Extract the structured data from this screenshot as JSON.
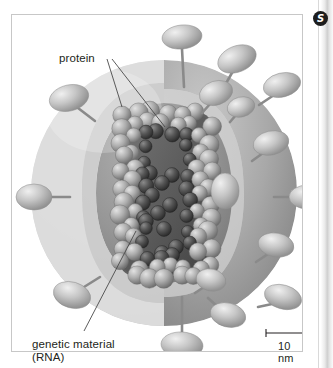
{
  "figure": {
    "badge": {
      "glyph": "S",
      "name": "chapter-badge"
    },
    "labels": {
      "protein": "protein",
      "genetic_material_line1": "genetic material",
      "genetic_material_line2": "(RNA)"
    },
    "scale_bar": {
      "label": "10 nm",
      "length_px": 40
    },
    "colors": {
      "envelope_outer": "#d9d9d9",
      "envelope_mid": "#b4b4b4",
      "envelope_inner": "#9a9a9a",
      "sphere_body": "#8e8e8e",
      "capsid_sphere": "#a0a0a0",
      "capsid_shadow": "#3a3a3a",
      "spike": "#bdbdbd",
      "stalk": "#8a8a8a",
      "leader_line": "#4a4a4a",
      "frame_border": "#c7c7c7",
      "badge_fill": "#1d1d1d",
      "text": "#231f20",
      "background": "#ffffff"
    },
    "structure": {
      "envelope_shape": "sphere-with-wedge-cutaway",
      "core_description": "helical nucleocapsid of globular protein subunits arranged in a rounded rectangular coil",
      "spike_count_visible": 16
    },
    "spikes": [
      {
        "cx": 170,
        "cy": 22,
        "rx": 20,
        "ry": 12,
        "rot": -6,
        "sx": 170,
        "sy": 34,
        "ex": 172,
        "ey": 72,
        "name": "spike-top"
      },
      {
        "cx": 225,
        "cy": 44,
        "rx": 20,
        "ry": 13,
        "rot": -22,
        "sx": 221,
        "sy": 56,
        "ex": 212,
        "ey": 72,
        "name": "spike-top-right"
      },
      {
        "cx": 270,
        "cy": 70,
        "rx": 19,
        "ry": 12,
        "rot": -14,
        "sx": 262,
        "sy": 80,
        "ex": 247,
        "ey": 90,
        "name": "spike-upper-right"
      },
      {
        "cx": 204,
        "cy": 78,
        "rx": 17,
        "ry": 12,
        "rot": -18,
        "sx": 198,
        "sy": 89,
        "ex": 190,
        "ey": 98,
        "name": "spike-surface-a"
      },
      {
        "cx": 259,
        "cy": 128,
        "rx": 18,
        "ry": 12,
        "rot": -12,
        "sx": 251,
        "sy": 138,
        "ex": 240,
        "ey": 146,
        "name": "spike-surface-b"
      },
      {
        "cx": 296,
        "cy": 182,
        "rx": 19,
        "ry": 12,
        "rot": 0,
        "sx": 283,
        "sy": 182,
        "ex": 262,
        "ey": 182,
        "name": "spike-right"
      },
      {
        "cx": 264,
        "cy": 230,
        "rx": 18,
        "ry": 12,
        "rot": 10,
        "sx": 256,
        "sy": 239,
        "ex": 244,
        "ey": 247,
        "name": "spike-surface-c"
      },
      {
        "cx": 271,
        "cy": 282,
        "rx": 19,
        "ry": 12,
        "rot": 16,
        "sx": 260,
        "sy": 289,
        "ex": 246,
        "ey": 292,
        "name": "spike-lower-right"
      },
      {
        "cx": 216,
        "cy": 300,
        "rx": 18,
        "ry": 12,
        "rot": 14,
        "sx": 207,
        "sy": 293,
        "ex": 196,
        "ey": 283,
        "name": "spike-surface-d"
      },
      {
        "cx": 199,
        "cy": 265,
        "rx": 15,
        "ry": 11,
        "rot": 12,
        "sx": 192,
        "sy": 272,
        "ex": 183,
        "ey": 278,
        "name": "spike-surface-e"
      },
      {
        "cx": 170,
        "cy": 330,
        "rx": 21,
        "ry": 13,
        "rot": 4,
        "sx": 170,
        "sy": 318,
        "ex": 170,
        "ey": 282,
        "name": "spike-bottom"
      },
      {
        "cx": 60,
        "cy": 280,
        "rx": 19,
        "ry": 13,
        "rot": 16,
        "sx": 72,
        "sy": 272,
        "ex": 88,
        "ey": 262,
        "name": "spike-lower-left"
      },
      {
        "cx": 22,
        "cy": 182,
        "rx": 18,
        "ry": 13,
        "rot": 0,
        "sx": 36,
        "sy": 182,
        "ex": 58,
        "ey": 182,
        "name": "spike-left"
      },
      {
        "cx": 57,
        "cy": 83,
        "rx": 20,
        "ry": 13,
        "rot": -14,
        "sx": 66,
        "sy": 93,
        "ex": 83,
        "ey": 106,
        "name": "spike-upper-left"
      },
      {
        "cx": 229,
        "cy": 92,
        "rx": 14,
        "ry": 10,
        "rot": -14,
        "sx": 224,
        "sy": 100,
        "ex": 218,
        "ey": 107,
        "name": "spike-surface-f"
      },
      {
        "cx": 213,
        "cy": 176,
        "rx": 14,
        "ry": 18,
        "rot": 0,
        "sx": 213,
        "sy": 176,
        "ex": 213,
        "ey": 176,
        "name": "spike-surface-g"
      }
    ],
    "leader_lines": [
      {
        "name": "leader-protein-envelope",
        "x1": 95,
        "y1": 44,
        "x2": 110,
        "y2": 92
      },
      {
        "name": "leader-protein-capsid",
        "x1": 100,
        "y1": 44,
        "x2": 153,
        "y2": 112
      },
      {
        "name": "leader-genetic-material",
        "x1": 72,
        "y1": 316,
        "x2": 124,
        "y2": 216
      }
    ]
  }
}
